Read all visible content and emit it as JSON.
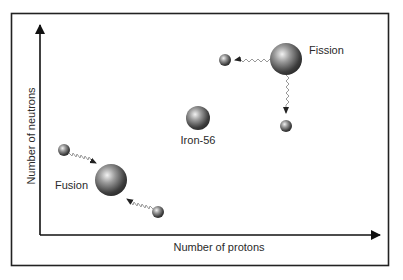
{
  "diagram": {
    "axes": {
      "x_label": "Number of protons",
      "y_label": "Number of neutrons"
    },
    "labels": {
      "fusion": "Fusion",
      "fission": "Fission",
      "iron": "Iron-56"
    },
    "colors": {
      "frame": "#222222",
      "axis": "#111111",
      "sphere_dark": "#3a3a3a",
      "sphere_light": "#e8e8e8",
      "wave": "#9a9a9a"
    },
    "nodes": [
      {
        "id": "fusion-reactant-1",
        "kind": "small nucleus",
        "x": 64,
        "y": 150
      },
      {
        "id": "fusion-product",
        "kind": "large nucleus",
        "x": 111,
        "y": 180
      },
      {
        "id": "fusion-reactant-2",
        "kind": "small nucleus",
        "x": 158,
        "y": 212
      },
      {
        "id": "iron-56",
        "kind": "medium nucleus",
        "x": 198,
        "y": 118
      },
      {
        "id": "fission-parent",
        "kind": "large nucleus",
        "x": 286,
        "y": 59
      },
      {
        "id": "fission-fragment-1",
        "kind": "small nucleus",
        "x": 225,
        "y": 60
      },
      {
        "id": "fission-fragment-2",
        "kind": "small nucleus",
        "x": 286,
        "y": 126
      }
    ]
  }
}
